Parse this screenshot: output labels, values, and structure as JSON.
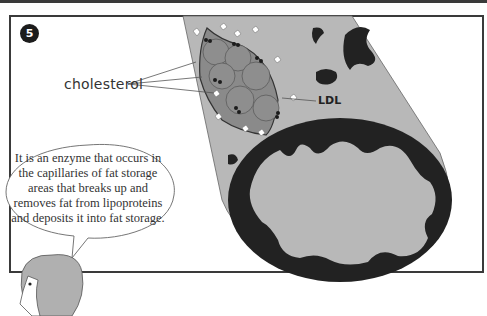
{
  "panel": {
    "number": "5",
    "labels": {
      "cholesterol": "cholesterol",
      "ldl": "LDL"
    },
    "speech_bubble": {
      "text": "It is an enzyme that occurs in the capillaries of fat storage areas that breaks up and removes fat from lipoproteins and deposits it into fat storage.",
      "lines": [
        "It is an enzyme that",
        "occurs in the capillaries of",
        "fat storage areas that breaks",
        "up and removes fat from",
        "lipoproteins and deposits it",
        "into fat storage."
      ]
    }
  },
  "colors": {
    "vessel_fill": "#b8b8b8",
    "plaque_dark": "#222222",
    "ldl_particle": "#8a8a8a",
    "frame": "#3a3a3a",
    "hair": "#b0b0b0"
  }
}
